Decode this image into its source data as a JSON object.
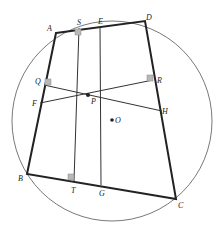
{
  "labels": {
    "A": "A",
    "B": "B",
    "C": "C",
    "D": "D",
    "E": "E",
    "F": "F",
    "G": "G",
    "H": "H",
    "P": "P",
    "Q": "Q",
    "R": "R",
    "S": "S",
    "T": "T",
    "O": "O"
  },
  "colors": {
    "stroke": "#333333",
    "thick": "#222222",
    "marker": "#b0b0b0"
  }
}
